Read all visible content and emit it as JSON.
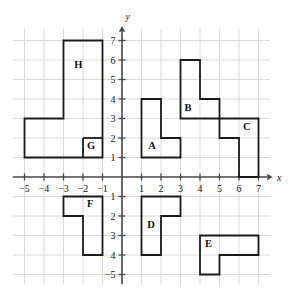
{
  "figure": {
    "background_color": "#ffffff",
    "stroke_color": "#1a1a1a",
    "grid_color": "#d8d8dc",
    "axis_color": "#4a4a4a"
  },
  "axes": {
    "x_label": "x",
    "y_label": "y",
    "origin_px": {
      "x": 122,
      "y": 177
    },
    "unit_px": 19.5,
    "x_range": [
      -5.6,
      7.6
    ],
    "y_range": [
      -5.5,
      7.6
    ],
    "x_ticks": [
      {
        "value": -5,
        "label": "−5"
      },
      {
        "value": -4,
        "label": "−4"
      },
      {
        "value": -3,
        "label": "−3"
      },
      {
        "value": -2,
        "label": "−2"
      },
      {
        "value": -1,
        "label": "−1"
      },
      {
        "value": 1,
        "label": "1"
      },
      {
        "value": 2,
        "label": "2"
      },
      {
        "value": 3,
        "label": "3"
      },
      {
        "value": 4,
        "label": "4"
      },
      {
        "value": 5,
        "label": "5"
      },
      {
        "value": 6,
        "label": "6"
      },
      {
        "value": 7,
        "label": "7"
      }
    ],
    "y_ticks": [
      {
        "value": 7,
        "label": "7"
      },
      {
        "value": 6,
        "label": "6"
      },
      {
        "value": 5,
        "label": "5"
      },
      {
        "value": 4,
        "label": "4"
      },
      {
        "value": 3,
        "label": "3"
      },
      {
        "value": 2,
        "label": "2"
      },
      {
        "value": 1,
        "label": "1"
      },
      {
        "value": -1,
        "label": "1"
      },
      {
        "value": -2,
        "label": "2"
      },
      {
        "value": -3,
        "label": "3"
      },
      {
        "value": -4,
        "label": "4"
      },
      {
        "value": -5,
        "label": "−5"
      }
    ]
  },
  "shapes": [
    {
      "id": "A",
      "label": "A",
      "label_at": {
        "x": 1.35,
        "y": 1.45
      },
      "points": [
        [
          1,
          1
        ],
        [
          3,
          1
        ],
        [
          3,
          2
        ],
        [
          2,
          2
        ],
        [
          2,
          4
        ],
        [
          1,
          4
        ]
      ]
    },
    {
      "id": "B",
      "label": "B",
      "label_at": {
        "x": 3.2,
        "y": 3.4
      },
      "points": [
        [
          3,
          3
        ],
        [
          3,
          6
        ],
        [
          4,
          6
        ],
        [
          4,
          4
        ],
        [
          5,
          4
        ],
        [
          5,
          3
        ]
      ]
    },
    {
      "id": "C",
      "label": "C",
      "label_at": {
        "x": 6.2,
        "y": 2.4
      },
      "points": [
        [
          5,
          3
        ],
        [
          7,
          3
        ],
        [
          7,
          0
        ],
        [
          6,
          0
        ],
        [
          6,
          2
        ],
        [
          5,
          2
        ]
      ]
    },
    {
      "id": "D",
      "label": "D",
      "label_at": {
        "x": 1.3,
        "y": -2.6
      },
      "points": [
        [
          1,
          -1
        ],
        [
          3,
          -1
        ],
        [
          3,
          -2
        ],
        [
          2,
          -2
        ],
        [
          2,
          -4
        ],
        [
          1,
          -4
        ]
      ]
    },
    {
      "id": "E",
      "label": "E",
      "label_at": {
        "x": 4.25,
        "y": -3.6
      },
      "points": [
        [
          4,
          -3
        ],
        [
          7,
          -3
        ],
        [
          7,
          -4
        ],
        [
          5,
          -4
        ],
        [
          5,
          -5
        ],
        [
          4,
          -5
        ]
      ]
    },
    {
      "id": "F",
      "label": "F",
      "label_at": {
        "x": -1.8,
        "y": -1.55
      },
      "points": [
        [
          -3,
          -1
        ],
        [
          -1,
          -1
        ],
        [
          -1,
          -4
        ],
        [
          -2,
          -4
        ],
        [
          -2,
          -2
        ],
        [
          -3,
          -2
        ]
      ]
    },
    {
      "id": "G",
      "label": "G",
      "label_at": {
        "x": -1.8,
        "y": 1.45
      },
      "points": [
        [
          -2,
          2
        ],
        [
          -1,
          2
        ],
        [
          -1,
          1
        ],
        [
          -2,
          1
        ]
      ]
    },
    {
      "id": "H",
      "label": "H",
      "label_at": {
        "x": -2.45,
        "y": 5.6
      },
      "points": [
        [
          -5,
          1
        ],
        [
          -5,
          3
        ],
        [
          -3,
          3
        ],
        [
          -3,
          7
        ],
        [
          -1,
          7
        ],
        [
          -1,
          4
        ],
        [
          -2,
          4
        ],
        [
          -2,
          2
        ],
        [
          -2,
          1
        ]
      ]
    }
  ],
  "outlines": [
    {
      "name": "left-combined-outline",
      "points": [
        [
          -5,
          1
        ],
        [
          -5,
          3
        ],
        [
          -3,
          3
        ],
        [
          -3,
          7
        ],
        [
          -1,
          7
        ],
        [
          -1,
          1
        ]
      ],
      "closed": true
    }
  ],
  "internal_dividers": [
    {
      "name": "g-h-divider-horizontal",
      "from": [
        -2,
        2
      ],
      "to": [
        -1,
        2
      ]
    },
    {
      "name": "g-h-divider-vertical",
      "from": [
        -2,
        2
      ],
      "to": [
        -2,
        1
      ]
    }
  ]
}
